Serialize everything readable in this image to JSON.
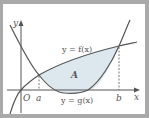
{
  "diagram": {
    "type": "area-between-curves",
    "axes": {
      "x_label": "x",
      "y_label": "y",
      "origin_label": "O"
    },
    "curves": [
      {
        "name": "f",
        "label": "y = f(x)",
        "shape": "concave increasing (logarithmic-like)"
      },
      {
        "name": "g",
        "label": "y = g(x)",
        "shape": "upward parabola"
      }
    ],
    "intersections": [
      {
        "label": "a"
      },
      {
        "label": "b"
      }
    ],
    "region": {
      "label": "A",
      "fill": "#dde8ee"
    },
    "colors": {
      "curve": "#555555",
      "axis": "#555555",
      "frame": "#a9a9a9",
      "background": "#ffffff"
    }
  }
}
